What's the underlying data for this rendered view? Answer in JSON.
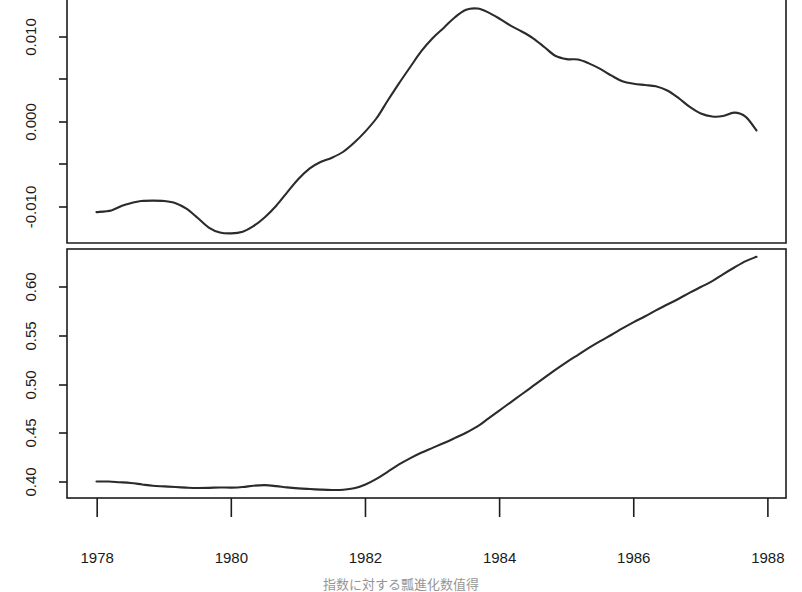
{
  "chart_data": [
    {
      "id": "top-panel",
      "type": "line",
      "title": "",
      "xlabel": "",
      "ylabel": "",
      "xlim": [
        1977.55,
        1988.27
      ],
      "ylim": [
        -0.0143,
        0.0144
      ],
      "grid": false,
      "legend": "none",
      "yticks": [
        -0.01,
        -0.005,
        0.0,
        0.005,
        0.01
      ],
      "ytick_labels": [
        "-0.010",
        "",
        "0.000",
        "",
        "0.010"
      ],
      "x": [
        1977.99,
        1978.21,
        1978.37,
        1978.5,
        1978.66,
        1978.83,
        1979.0,
        1979.17,
        1979.33,
        1979.5,
        1979.67,
        1979.83,
        1980.0,
        1980.17,
        1980.33,
        1980.5,
        1980.67,
        1980.83,
        1981.0,
        1981.17,
        1981.33,
        1981.5,
        1981.67,
        1981.83,
        1982.0,
        1982.17,
        1982.33,
        1982.5,
        1982.67,
        1982.83,
        1983.0,
        1983.17,
        1983.33,
        1983.5,
        1983.67,
        1983.83,
        1984.0,
        1984.17,
        1984.33,
        1984.5,
        1984.67,
        1984.83,
        1985.0,
        1985.17,
        1985.33,
        1985.5,
        1985.67,
        1985.83,
        1986.0,
        1986.17,
        1986.33,
        1986.5,
        1986.67,
        1986.83,
        1987.0,
        1987.17,
        1987.33,
        1987.5,
        1987.67,
        1987.83
      ],
      "values": [
        -0.0106,
        -0.0104,
        -0.00985,
        -0.00955,
        -0.0093,
        -0.00925,
        -0.0093,
        -0.00955,
        -0.0102,
        -0.0113,
        -0.01245,
        -0.013,
        -0.0131,
        -0.0129,
        -0.01225,
        -0.0112,
        -0.00985,
        -0.0083,
        -0.0067,
        -0.00545,
        -0.0047,
        -0.0042,
        -0.0035,
        -0.00245,
        -0.0011,
        0.0005,
        0.0025,
        0.00455,
        0.0065,
        0.0083,
        0.00985,
        0.0111,
        0.0123,
        0.0132,
        0.01335,
        0.0129,
        0.01215,
        0.0113,
        0.01065,
        0.00985,
        0.0088,
        0.0078,
        0.0074,
        0.00735,
        0.0069,
        0.00625,
        0.00545,
        0.0048,
        0.0045,
        0.00435,
        0.0042,
        0.0037,
        0.0028,
        0.0018,
        0.001,
        0.00065,
        0.0007,
        0.0011,
        0.0006,
        -0.001
      ],
      "value_range_note": "residual / first-difference component"
    },
    {
      "id": "bottom-panel",
      "type": "line",
      "title": "",
      "xlabel": "",
      "ylabel": "",
      "xlim": [
        1977.55,
        1988.27
      ],
      "ylim": [
        0.3855,
        0.643
      ],
      "grid": false,
      "legend": "none",
      "yticks": [
        0.4,
        0.45,
        0.5,
        0.55,
        0.6
      ],
      "ytick_labels": [
        "0.40",
        "0.45",
        "0.50",
        "0.55",
        "0.60"
      ],
      "x": [
        1977.99,
        1978.17,
        1978.33,
        1978.5,
        1978.67,
        1978.83,
        1979.0,
        1979.17,
        1979.33,
        1979.5,
        1979.67,
        1979.83,
        1980.0,
        1980.17,
        1980.33,
        1980.5,
        1980.67,
        1980.83,
        1981.0,
        1981.17,
        1981.33,
        1981.5,
        1981.67,
        1981.83,
        1982.0,
        1982.17,
        1982.33,
        1982.5,
        1982.67,
        1982.83,
        1983.0,
        1983.17,
        1983.33,
        1983.5,
        1983.67,
        1983.83,
        1984.0,
        1984.17,
        1984.33,
        1984.5,
        1984.67,
        1984.83,
        1985.0,
        1985.17,
        1985.33,
        1985.5,
        1985.67,
        1985.83,
        1986.0,
        1986.17,
        1986.33,
        1986.5,
        1986.67,
        1986.83,
        1987.0,
        1987.17,
        1987.33,
        1987.5,
        1987.67,
        1987.83
      ],
      "values": [
        0.4005,
        0.4005,
        0.3998,
        0.399,
        0.3975,
        0.3962,
        0.3955,
        0.3948,
        0.3942,
        0.3938,
        0.394,
        0.3944,
        0.3942,
        0.3948,
        0.3962,
        0.3968,
        0.3958,
        0.3945,
        0.3935,
        0.3928,
        0.3922,
        0.3918,
        0.392,
        0.3935,
        0.3975,
        0.4035,
        0.4105,
        0.418,
        0.4245,
        0.43,
        0.435,
        0.44,
        0.445,
        0.4505,
        0.457,
        0.465,
        0.4735,
        0.482,
        0.49,
        0.4985,
        0.507,
        0.515,
        0.523,
        0.5305,
        0.5375,
        0.5445,
        0.551,
        0.5575,
        0.564,
        0.57,
        0.576,
        0.582,
        0.588,
        0.594,
        0.6,
        0.606,
        0.613,
        0.62,
        0.6265,
        0.631
      ],
      "value_range_note": "level / trend component"
    }
  ],
  "axes": {
    "x_tick_values": [
      1978,
      1980,
      1982,
      1984,
      1986,
      1988
    ],
    "x_tick_labels": [
      "1978",
      "1980",
      "1982",
      "1984",
      "1986",
      "1988"
    ],
    "top_y_tick_labels": [
      "0.010",
      "0.000",
      "-0.010"
    ],
    "bottom_y_tick_labels": [
      "0.60",
      "0.55",
      "0.50",
      "0.45",
      "0.40"
    ]
  },
  "style": {
    "line_color": "#2b2b2b",
    "axis_color": "#1c1c1c",
    "text_color": "#1a1a1a",
    "background": "#ffffff"
  }
}
